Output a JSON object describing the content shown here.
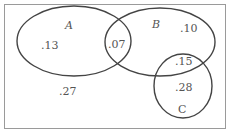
{
  "diagram": {
    "type": "venn",
    "sets": [
      {
        "name": "A",
        "label": "A"
      },
      {
        "name": "B",
        "label": "B"
      },
      {
        "name": "C",
        "label": "C"
      }
    ],
    "regions": {
      "a_only": ".13",
      "a_and_b": ".07",
      "b_only": ".10",
      "b_and_c": ".15",
      "c_only": ".28",
      "outside": ".27"
    },
    "colors": {
      "outline": "#444444",
      "border": "#999999",
      "text": "#555555",
      "background": "#ffffff"
    }
  }
}
